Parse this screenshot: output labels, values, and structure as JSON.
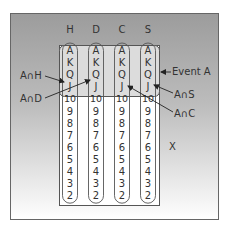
{
  "diagram": {
    "suits": [
      "H",
      "D",
      "C",
      "S"
    ],
    "ranks": [
      "A",
      "K",
      "Q",
      "J",
      "10",
      "9",
      "8",
      "7",
      "6",
      "5",
      "4",
      "3",
      "2"
    ],
    "labels": {
      "a_and_h": "A∩H",
      "a_and_d": "A∩D",
      "event_a": "Event A",
      "a_and_s": "A∩S",
      "a_and_c": "A∩C",
      "sample_space": "X"
    },
    "colors": {
      "frame_top": "#9a9a9a",
      "frame_bottom": "#ffffff",
      "deck_bg": "#ffffff",
      "event_fill": "#d9d9d9",
      "outline": "#555555",
      "text": "#333333"
    }
  }
}
